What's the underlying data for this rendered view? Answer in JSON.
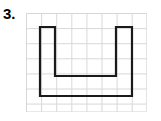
{
  "problem": {
    "number_label": "3.",
    "figure_type": "grid-polygon"
  },
  "figure": {
    "name": "u-shape-on-grid",
    "grid": {
      "cell_size_px": 15.1,
      "columns": 8,
      "rows": 6.55,
      "origin_x_px": 26,
      "origin_y_px": 13,
      "line_color": "#d8d8d8",
      "line_width_px": 1,
      "background_color": "#ffffff"
    },
    "shape": {
      "label": "U-shape",
      "stroke_color": "#1a1a1a",
      "stroke_width_px": 2.2,
      "fill": "none",
      "closed": true,
      "vertices_px": [
        [
          14,
          14
        ],
        [
          29,
          14
        ],
        [
          29,
          63
        ],
        [
          90,
          63
        ],
        [
          90,
          14
        ],
        [
          106,
          14
        ],
        [
          106,
          83
        ],
        [
          14,
          83
        ]
      ],
      "vertices_grid_units": [
        [
          0.93,
          0.93
        ],
        [
          1.92,
          0.93
        ],
        [
          1.92,
          4.17
        ],
        [
          5.96,
          4.17
        ],
        [
          5.96,
          0.93
        ],
        [
          7.02,
          0.93
        ],
        [
          7.02,
          5.5
        ],
        [
          0.93,
          5.5
        ]
      ]
    }
  },
  "colors": {
    "page_background": "#ffffff",
    "text": "#000000",
    "grid_line": "#d8d8d8",
    "shape_stroke": "#1a1a1a"
  }
}
